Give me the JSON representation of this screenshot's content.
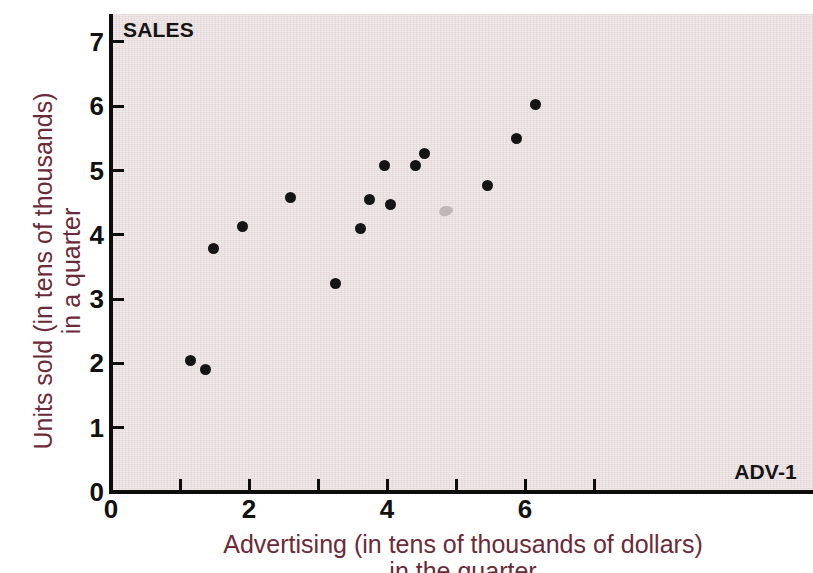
{
  "chart_data": {
    "type": "scatter",
    "title": "",
    "xlabel": "Advertising (in tens of thousands of dollars)",
    "xlabel_line2": "in the quarter",
    "ylabel": "Units sold (in tens of thousands)",
    "ylabel_line2": "in a quarter",
    "xlim": [
      0,
      7.2
    ],
    "ylim": [
      0,
      7.3
    ],
    "xticks": [
      0,
      1,
      2,
      3,
      4,
      5,
      6,
      7
    ],
    "xticklabels": [
      "0",
      "",
      "2",
      "",
      "4",
      "",
      "6",
      ""
    ],
    "yticks": [
      0,
      1,
      2,
      3,
      4,
      5,
      6,
      7
    ],
    "yticklabels": [
      "0",
      "1",
      "2",
      "3",
      "4",
      "5",
      "6",
      "7"
    ],
    "grid": false,
    "legend": "none",
    "x": [
      1.15,
      1.37,
      1.48,
      1.9,
      2.6,
      3.25,
      3.62,
      3.75,
      3.97,
      4.05,
      4.42,
      4.55,
      4.83,
      5.45,
      5.88,
      6.15
    ],
    "y": [
      2.05,
      1.9,
      3.78,
      4.13,
      4.58,
      3.24,
      4.1,
      4.55,
      5.07,
      4.47,
      5.08,
      5.27,
      4.37,
      4.77,
      5.5,
      6.03
    ],
    "points": [
      {
        "x": 1.15,
        "y": 2.05,
        "state": "normal"
      },
      {
        "x": 1.37,
        "y": 1.9,
        "state": "normal"
      },
      {
        "x": 1.48,
        "y": 3.78,
        "state": "normal"
      },
      {
        "x": 1.9,
        "y": 4.13,
        "state": "normal"
      },
      {
        "x": 2.6,
        "y": 4.58,
        "state": "normal"
      },
      {
        "x": 3.25,
        "y": 3.24,
        "state": "normal"
      },
      {
        "x": 3.62,
        "y": 4.1,
        "state": "normal"
      },
      {
        "x": 3.75,
        "y": 4.55,
        "state": "normal"
      },
      {
        "x": 3.97,
        "y": 5.07,
        "state": "normal"
      },
      {
        "x": 4.05,
        "y": 4.47,
        "state": "normal"
      },
      {
        "x": 4.42,
        "y": 5.08,
        "state": "normal"
      },
      {
        "x": 4.55,
        "y": 5.27,
        "state": "normal"
      },
      {
        "x": 4.83,
        "y": 4.37,
        "state": "faded"
      },
      {
        "x": 5.45,
        "y": 4.77,
        "state": "normal"
      },
      {
        "x": 5.88,
        "y": 5.5,
        "state": "normal"
      },
      {
        "x": 6.15,
        "y": 6.03,
        "state": "normal"
      }
    ],
    "marker_color": "#141414",
    "faded_marker_color": "#b9aeae",
    "plot_background": "#e9dfdf",
    "axis_color": "#0d0d0d",
    "axis_title_color": "#6b2a38"
  },
  "annotations": {
    "sales_label": "SALES",
    "adv_label": "ADV-1"
  }
}
